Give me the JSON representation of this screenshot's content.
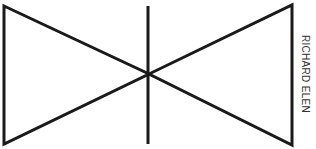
{
  "figure": {
    "stroke_color": "#1a1a1a",
    "background_color": "#ffffff"
  },
  "credit": {
    "text": "RICHARD ELEN"
  }
}
